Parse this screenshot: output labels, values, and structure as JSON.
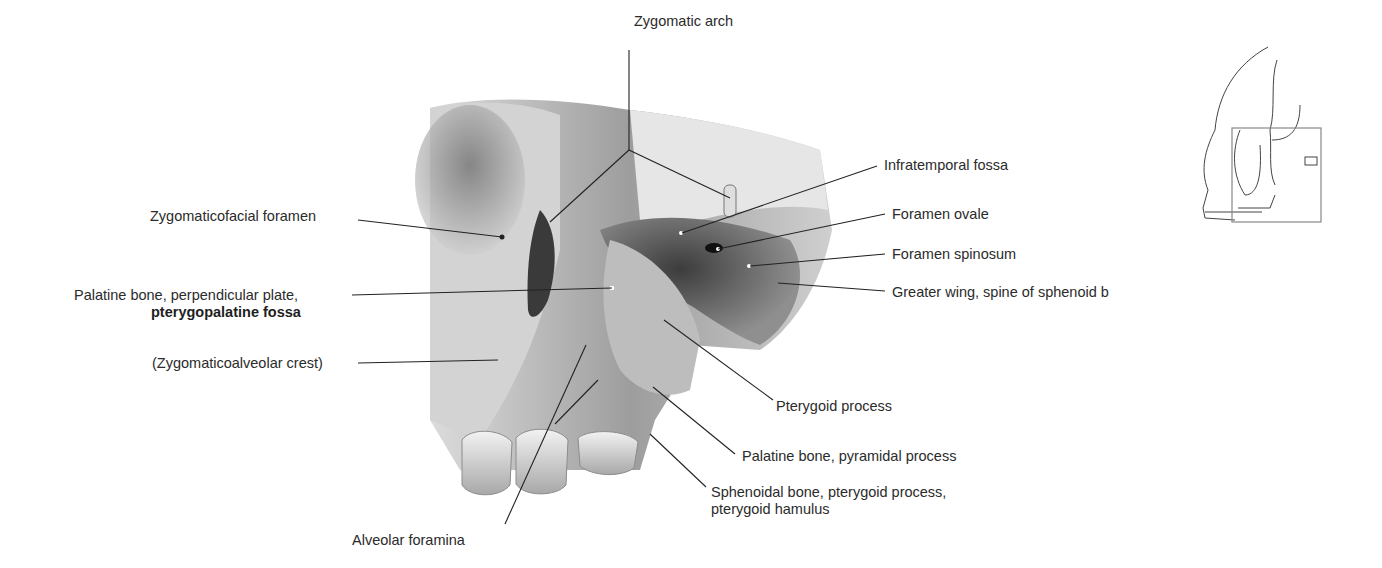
{
  "figure": {
    "labels": [
      {
        "id": "zygomatic-arch",
        "text": "Zygomatic arch",
        "x": 634,
        "y": 40
      },
      {
        "id": "infratemporal-fossa",
        "text": "Infratemporal fossa",
        "x": 884,
        "y": 157
      },
      {
        "id": "foramen-ovale",
        "text": "Foramen ovale",
        "x": 892,
        "y": 207
      },
      {
        "id": "foramen-spinosum",
        "text": "Foramen spinosum",
        "x": 892,
        "y": 247
      },
      {
        "id": "greater-wing",
        "text": "Greater wing, spine of sphenoid b",
        "x": 892,
        "y": 284
      },
      {
        "id": "zygomaticofacial-foramen",
        "text": "Zygomaticofacial foramen",
        "x": 150,
        "y": 208
      },
      {
        "id": "palatine-perpendicular",
        "text": "Palatine bone, perpendicular plate,",
        "x": 74,
        "y": 288
      },
      {
        "id": "pterygopalatine-fossa",
        "text": "pterygopalatine fossa",
        "x": 151,
        "y": 305,
        "bold": true
      },
      {
        "id": "zygomaticoalveolar-crest",
        "text": "(Zygomaticoalveolar crest)",
        "x": 152,
        "y": 356
      },
      {
        "id": "pterygoid-process",
        "text": "Pterygoid process",
        "x": 776,
        "y": 397
      },
      {
        "id": "palatine-pyramidal",
        "text": "Palatine bone, pyramidal process",
        "x": 742,
        "y": 448
      },
      {
        "id": "sphenoidal-hamulus-1",
        "text": "Sphenoidal bone, pterygoid process,",
        "x": 711,
        "y": 485
      },
      {
        "id": "sphenoidal-hamulus-2",
        "text": "pterygoid hamulus",
        "x": 711,
        "y": 502
      },
      {
        "id": "alveolar-foramina",
        "text": "Alveolar foramina",
        "x": 352,
        "y": 532
      }
    ],
    "colors": {
      "bone_light": "#e4e4e4",
      "bone_mid": "#a9a9a9",
      "bone_dark": "#4f4f4f",
      "line": "#222222",
      "box": "#888888"
    }
  },
  "orientation_sketch": {
    "description": "Lateral skull outline with region box"
  }
}
